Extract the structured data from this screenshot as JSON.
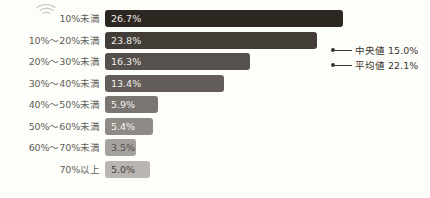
{
  "chart_data": {
    "type": "bar",
    "orientation": "horizontal",
    "title": "",
    "subtitle": "",
    "xlabel": "",
    "ylabel": "",
    "grid": false,
    "xlim": [
      0,
      30
    ],
    "legend_position": "right",
    "categories": [
      "10%未満",
      "10%〜20%未満",
      "20%〜30%未満",
      "30%〜40%未満",
      "40%〜50%未満",
      "50%〜60%未満",
      "60%〜70%未満",
      "70%以上"
    ],
    "values": [
      26.7,
      23.8,
      16.3,
      13.4,
      5.9,
      5.4,
      3.5,
      5.0
    ],
    "value_labels": [
      "26.7%",
      "23.8%",
      "16.3%",
      "13.4%",
      "5.9%",
      "5.4%",
      "3.5%",
      "5.0%"
    ],
    "bar_colors": [
      "#2d2722",
      "#433d38",
      "#56514c",
      "#635e59",
      "#7a7570",
      "#8e8a85",
      "#a5a29d",
      "#b9b6b1"
    ],
    "value_label_colors": [
      "#efeeea",
      "#efeeea",
      "#f2f1ed",
      "#f2f1ed",
      "#f4f3ef",
      "#f6f5f2",
      "#55514c",
      "#45413c"
    ],
    "annotations": [
      {
        "label": "中央値",
        "value": "15.0%",
        "text": "中央値 15.0%"
      },
      {
        "label": "平均値",
        "value": "22.1%",
        "text": "平均値 22.1%"
      }
    ]
  },
  "icons": {
    "wifi": "wifi-icon"
  },
  "colors": {
    "background": "#fdfdf9",
    "label_text": "#5d5d58",
    "legend_text": "#3b352f",
    "legend_marker": "#3b352f"
  }
}
